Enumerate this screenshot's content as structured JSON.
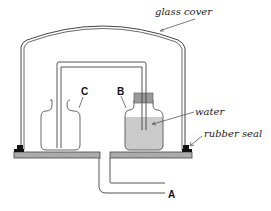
{
  "diagram": {
    "title": "",
    "labels": {
      "glass_cover": "glass cover",
      "water": "water",
      "rubber_seal": "rubber seal",
      "A": "A",
      "B": "B",
      "C": "C"
    },
    "components": [
      {
        "id": "glass-cover",
        "label": "glass cover"
      },
      {
        "id": "rubber-seal",
        "label": "rubber seal"
      },
      {
        "id": "base-plate",
        "label": ""
      },
      {
        "id": "outlet-tube",
        "label": "A"
      },
      {
        "id": "bottle-with-water",
        "label": "B"
      },
      {
        "id": "empty-bottle",
        "label": "C"
      },
      {
        "id": "water",
        "label": "water"
      },
      {
        "id": "siphon-tube",
        "label": ""
      }
    ],
    "colors": {
      "line": "#333333",
      "water_fill": "#c8c8c8",
      "base_fill": "#a8a8a8",
      "seal_fill": "#111111",
      "stopper_fill": "#9a9a9a"
    }
  }
}
